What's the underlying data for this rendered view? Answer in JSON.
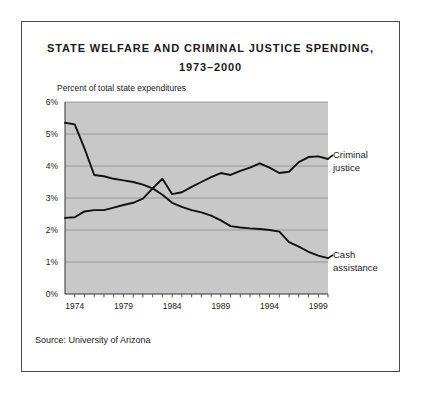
{
  "figure": {
    "title_line1": "STATE WELFARE AND CRIMINAL JUSTICE SPENDING,",
    "title_line2": "1973–2000",
    "axis_note": "Percent of total state expenditures",
    "source": "Source: University of Arizona",
    "border_color": "#4a4a4a",
    "page_background": "#ffffff"
  },
  "chart_data": {
    "type": "line",
    "title": "STATE WELFARE AND CRIMINAL JUSTICE SPENDING, 1973–2000",
    "subtitle": "1973–2000",
    "xlabel": "",
    "ylabel": "Percent of total state expenditures",
    "xlim": [
      1973,
      2000
    ],
    "ylim": [
      0,
      6
    ],
    "yticks": [
      0,
      1,
      2,
      3,
      4,
      5,
      6
    ],
    "ytick_labels": [
      "0%",
      "1%",
      "2%",
      "3%",
      "4%",
      "5%",
      "6%"
    ],
    "xticks": [
      1974,
      1979,
      1984,
      1989,
      1994,
      1999
    ],
    "xtick_labels": [
      "1974",
      "1979",
      "1984",
      "1989",
      "1994",
      "1999"
    ],
    "xticks_minor_step": 1,
    "grid": true,
    "grid_color": "#8c8c8c",
    "plot_background": "#c8c8c8",
    "line_color": "#111111",
    "legend_position": "right-inline-labels",
    "x": [
      1973,
      1974,
      1975,
      1976,
      1977,
      1978,
      1979,
      1980,
      1981,
      1982,
      1983,
      1984,
      1985,
      1986,
      1987,
      1988,
      1989,
      1990,
      1991,
      1992,
      1993,
      1994,
      1995,
      1996,
      1997,
      1998,
      1999,
      2000
    ],
    "series": [
      {
        "name": "Cash assistance",
        "label_line1": "Cash",
        "label_line2": "assistance",
        "values": [
          5.35,
          5.3,
          4.55,
          3.72,
          3.68,
          3.6,
          3.55,
          3.5,
          3.42,
          3.3,
          3.1,
          2.85,
          2.72,
          2.62,
          2.55,
          2.45,
          2.3,
          2.12,
          2.08,
          2.05,
          2.03,
          2.0,
          1.95,
          1.62,
          1.48,
          1.32,
          1.2,
          1.12
        ]
      },
      {
        "name": "Criminal justice",
        "label_line1": "Criminal",
        "label_line2": "justice",
        "values": [
          2.38,
          2.4,
          2.58,
          2.62,
          2.62,
          2.7,
          2.78,
          2.85,
          2.98,
          3.3,
          3.6,
          3.12,
          3.18,
          3.35,
          3.5,
          3.65,
          3.78,
          3.72,
          3.85,
          3.95,
          4.08,
          3.95,
          3.78,
          3.82,
          4.12,
          4.28,
          4.3,
          4.22
        ]
      }
    ]
  }
}
